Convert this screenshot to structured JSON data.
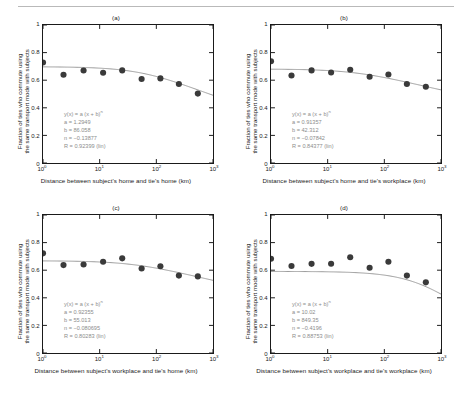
{
  "figure": {
    "background": "#ffffff",
    "marker_color": "#3a3a3a",
    "curve_color": "#9a9a9a",
    "text_color": "#1a1a1a",
    "annotation_color": "#8c8c8c",
    "ylabel_line1": "Fraction of ties who commute using",
    "ylabel_line2": "the same transport mode with subjects",
    "yticks": [
      "0",
      "0.2",
      "0.4",
      "0.6",
      "0.8",
      "1"
    ],
    "ytick_values": [
      0,
      0.2,
      0.4,
      0.6,
      0.8,
      1
    ],
    "xticks": [
      "0",
      "1",
      "2",
      "3"
    ],
    "xtick_base": "10",
    "ylim": [
      0,
      1
    ],
    "xlim_log10": [
      0,
      3
    ]
  },
  "panels": [
    {
      "tag": "(a)",
      "xlabel": "Distance between subject's home and tie's home (km)",
      "fit": {
        "equation_prefix": "y(x) = a (x + b)",
        "equation_exponent": "n",
        "a_label": "a = 1.2949",
        "b_label": "b = 86.058",
        "n_label": "n = −0.13877",
        "r_label": "R = 0.92399  (lin)"
      },
      "chart_data": {
        "type": "scatter",
        "x": [
          2.3,
          5.2,
          11.5,
          25.0,
          55.0,
          118.0,
          250.0,
          540.0
        ],
        "y": [
          0.639,
          0.67,
          0.654,
          0.671,
          0.609,
          0.613,
          0.572,
          0.503
        ],
        "left_edge_point": {
          "x": 1.0,
          "y": 0.728
        },
        "fit_curve": {
          "a": 1.2949,
          "b": 86.058,
          "n": -0.13877
        }
      }
    },
    {
      "tag": "(b)",
      "xlabel": "Distance between subject's home and tie's workplace (km)",
      "fit": {
        "equation_prefix": "y(x) = a (x + b)",
        "equation_exponent": "n",
        "a_label": "a = 0.91357",
        "b_label": "b = 42.312",
        "n_label": "n = −0.07842",
        "r_label": "R = 0.84377  (lin)"
      },
      "chart_data": {
        "type": "scatter",
        "x": [
          2.3,
          5.2,
          11.5,
          25.0,
          55.0,
          118.0,
          250.0,
          540.0
        ],
        "y": [
          0.634,
          0.671,
          0.656,
          0.676,
          0.625,
          0.641,
          0.572,
          0.553
        ],
        "left_edge_point": {
          "x": 1.0,
          "y": 0.737
        },
        "fit_curve": {
          "a": 0.91357,
          "b": 42.312,
          "n": -0.07842
        }
      }
    },
    {
      "tag": "(c)",
      "xlabel": "Distance between subject's workplace and tie's home (km)",
      "fit": {
        "equation_prefix": "y(x) = a (x + b)",
        "equation_exponent": "n",
        "a_label": "a = 0.92355",
        "b_label": "b = 55.013",
        "n_label": "n = −0.080695",
        "r_label": "R = 0.80283  (lin)"
      },
      "chart_data": {
        "type": "scatter",
        "x": [
          2.3,
          5.2,
          11.5,
          25.0,
          55.0,
          118.0,
          250.0,
          540.0
        ],
        "y": [
          0.637,
          0.641,
          0.661,
          0.686,
          0.612,
          0.629,
          0.561,
          0.555
        ],
        "left_edge_point": {
          "x": 1.0,
          "y": 0.722
        },
        "fit_curve": {
          "a": 0.92355,
          "b": 55.013,
          "n": -0.080695
        }
      }
    },
    {
      "tag": "(d)",
      "xlabel": "Distance between subject's workplace and tie's workplace (km)",
      "fit": {
        "equation_prefix": "y(x) = a (x + b)",
        "equation_exponent": "n",
        "a_label": "a = 10.02",
        "b_label": "b = 849.35",
        "n_label": "n = −0.4196",
        "r_label": "R = 0.88753  (lin)"
      },
      "chart_data": {
        "type": "scatter",
        "x": [
          2.3,
          5.2,
          11.5,
          25.0,
          55.0,
          118.0,
          250.0,
          540.0
        ],
        "y": [
          0.63,
          0.646,
          0.647,
          0.694,
          0.618,
          0.661,
          0.561,
          0.512
        ],
        "left_edge_point": {
          "x": 1.0,
          "y": 0.683
        },
        "fit_curve": {
          "a": 10.02,
          "b": 849.35,
          "n": -0.4196
        }
      }
    }
  ]
}
